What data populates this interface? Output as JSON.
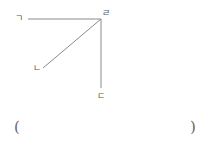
{
  "diagram": {
    "vertex": {
      "label": "ㄹ",
      "x": 101,
      "y": 19
    },
    "rays": [
      {
        "label": "ㄱ",
        "to_x": 28,
        "to_y": 19,
        "direction": "left"
      },
      {
        "label": "ㄴ",
        "to_x": 43,
        "to_y": 68,
        "direction": "down-left"
      },
      {
        "label": "ㄷ",
        "to_x": 101,
        "to_y": 88,
        "direction": "down"
      }
    ],
    "line_color": "#8a8a8a"
  },
  "answer": {
    "open_paren": "(",
    "close_paren": ")",
    "value": ""
  }
}
